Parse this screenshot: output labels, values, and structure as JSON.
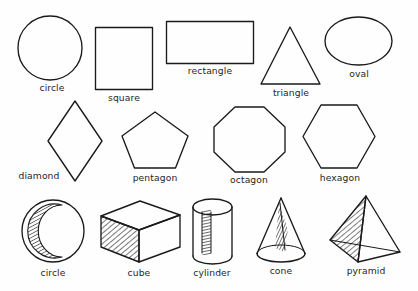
{
  "figure": {
    "background_color": "#fefefe",
    "stroke_color": "#1a1a1a",
    "label_color": "#262626",
    "rows": [
      {
        "row_index": 1,
        "shapes": [
          {
            "name": "circle",
            "label": "circle",
            "kind": "2d",
            "label_x": 52,
            "label_y": 88
          },
          {
            "name": "square",
            "label": "square",
            "kind": "2d",
            "label_x": 124,
            "label_y": 98
          },
          {
            "name": "rectangle",
            "label": "rectangle",
            "kind": "2d",
            "label_x": 210,
            "label_y": 71
          },
          {
            "name": "triangle",
            "label": "triangle",
            "kind": "2d",
            "label_x": 291,
            "label_y": 93
          },
          {
            "name": "oval",
            "label": "oval",
            "kind": "2d",
            "label_x": 359,
            "label_y": 74
          }
        ]
      },
      {
        "row_index": 2,
        "shapes": [
          {
            "name": "diamond",
            "label": "diamond",
            "kind": "2d",
            "label_x": 39,
            "label_y": 177
          },
          {
            "name": "pentagon",
            "label": "pentagon",
            "kind": "2d",
            "label_x": 155,
            "label_y": 178
          },
          {
            "name": "octagon",
            "label": "octagon",
            "kind": "2d",
            "label_x": 249,
            "label_y": 180
          },
          {
            "name": "hexagon",
            "label": "hexagon",
            "kind": "2d",
            "label_x": 340,
            "label_y": 178
          }
        ]
      },
      {
        "row_index": 3,
        "shapes": [
          {
            "name": "sphere",
            "label": "circle",
            "kind": "3d",
            "label_x": 53,
            "label_y": 274
          },
          {
            "name": "cube",
            "label": "cube",
            "kind": "3d",
            "label_x": 139,
            "label_y": 274
          },
          {
            "name": "cylinder",
            "label": "cylinder",
            "kind": "3d",
            "label_x": 212,
            "label_y": 274
          },
          {
            "name": "cone",
            "label": "cone",
            "kind": "3d",
            "label_x": 281,
            "label_y": 272
          },
          {
            "name": "pyramid",
            "label": "pyramid",
            "kind": "3d",
            "label_x": 366,
            "label_y": 272
          }
        ]
      }
    ]
  }
}
